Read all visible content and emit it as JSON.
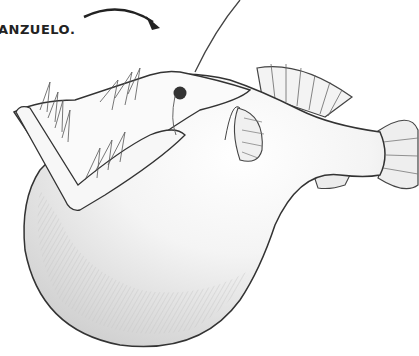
{
  "caption": {
    "text": "ANZUELO."
  },
  "illustration": {
    "subject": "anglerfish-sketch",
    "stroke_color": "#333333",
    "shade_color": "#bdbdbd",
    "background": "#ffffff"
  }
}
